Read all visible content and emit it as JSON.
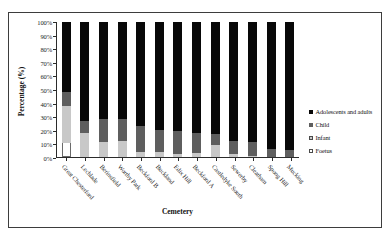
{
  "chart_data": {
    "type": "bar",
    "subtype": "stacked-100-percent",
    "title": "",
    "xlabel": "Cemetery",
    "ylabel": "Percentage (%)",
    "ylim": [
      0,
      100
    ],
    "yticks": [
      "0%",
      "10%",
      "20%",
      "30%",
      "40%",
      "50%",
      "60%",
      "70%",
      "80%",
      "90%",
      "100%"
    ],
    "ytick_values": [
      0,
      10,
      20,
      30,
      40,
      50,
      60,
      70,
      80,
      90,
      100
    ],
    "grid": false,
    "legend_position": "right",
    "categories": [
      "Great Chesterford",
      "Lechlade",
      "Berinsfield",
      "Worthy Park",
      "Beckford B",
      "Buckland",
      "Edix Hill",
      "Beckford A",
      "Castledyke South",
      "Sewerby",
      "Cleatham",
      "Spong Hill",
      "Mucking"
    ],
    "series": [
      {
        "name": "Foetus",
        "color": "#ffffff",
        "values": [
          10,
          0,
          0,
          0,
          0,
          0,
          0,
          0,
          0,
          0,
          0,
          0,
          0
        ]
      },
      {
        "name": "Infant",
        "color": "#c8c8c8",
        "values": [
          28,
          18,
          11,
          12,
          4,
          4,
          2,
          3,
          9,
          2,
          1,
          0,
          0
        ]
      },
      {
        "name": "Child",
        "color": "#5e5e5e",
        "values": [
          10,
          9,
          17,
          16,
          19,
          16,
          17,
          15,
          8,
          10,
          10,
          6,
          5
        ]
      },
      {
        "name": "Adolescents and adults",
        "color": "#080808",
        "values": [
          52,
          73,
          72,
          72,
          77,
          80,
          81,
          82,
          83,
          88,
          89,
          94,
          95
        ]
      }
    ],
    "legend_entries": [
      {
        "label": "Adolescents and adults",
        "swatch": "black"
      },
      {
        "label": "Child",
        "swatch": "dark-gray"
      },
      {
        "label": "Infant",
        "swatch": "light-gray"
      },
      {
        "label": "Foetus",
        "swatch": "white"
      }
    ]
  }
}
